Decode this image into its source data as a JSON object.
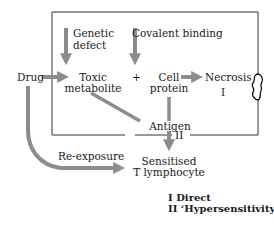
{
  "diagram": {
    "nodes": {
      "drug": "Drug",
      "genetic_defect_line1": "Genetic",
      "genetic_defect_line2": "defect",
      "covalent_binding": "Covalent binding",
      "toxic_metabolite_line1": "Toxic",
      "toxic_metabolite_line2": "metabolite",
      "plus": "+",
      "cell_protein_line1": "Cell",
      "cell_protein_line2": "protein",
      "necrosis": "Necrosis",
      "pathway_i": "I",
      "antigen": "Antigen",
      "pathway_ii": "II",
      "re_exposure": "Re-exposure",
      "sensitised_line1": "Sensitised",
      "sensitised_line2": "T lymphocyte"
    },
    "legend": {
      "line1": "I Direct",
      "line2": "II ‘Hypersensitivity’"
    },
    "colors": {
      "arrow": "#8c8c8c",
      "box_line": "#333333",
      "text": "#1a1a1a"
    }
  }
}
